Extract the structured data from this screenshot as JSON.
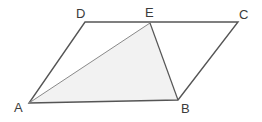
{
  "figure": {
    "type": "geometry-diagram",
    "canvas": {
      "width": 262,
      "height": 122,
      "background": "#ffffff"
    },
    "styles": {
      "outline_color": "#555555",
      "diagonal_color": "#8a8a8a",
      "shade_fill": "#f2f2f2",
      "label_color": "#3b3b3b",
      "outline_width": 1.4,
      "diagonal_width": 1
    },
    "points": {
      "A": {
        "label": "A",
        "x": 29,
        "y": 103
      },
      "B": {
        "label": "B",
        "x": 178,
        "y": 100
      },
      "C": {
        "label": "C",
        "x": 238,
        "y": 22
      },
      "D": {
        "label": "D",
        "x": 85,
        "y": 22
      },
      "E": {
        "label": "E",
        "x": 150,
        "y": 23
      }
    },
    "polygons": {
      "parallelogram": "29,103 178,100 238,22 85,22",
      "shaded_triangle": "29,103 178,100 150,23"
    },
    "segments": {
      "AB": "29,103 178,100",
      "BC": "178,100 238,22",
      "CD": "238,22 85,22",
      "DA": "85,22 29,103",
      "AE": "29,103 150,23",
      "EB": "150,23 178,100"
    }
  }
}
